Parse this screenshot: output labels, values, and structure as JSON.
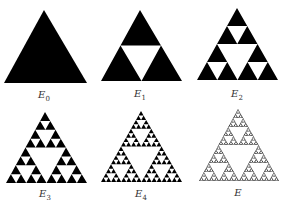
{
  "figure": {
    "fill_color": "#000000",
    "background": "#ffffff",
    "panels": [
      {
        "label": "E",
        "subscript": "0",
        "level": 0,
        "apex": [
          44,
          10
        ],
        "left": [
          4,
          83
        ],
        "right": [
          87,
          83
        ],
        "label_pos": [
          44,
          90
        ]
      },
      {
        "label": "E",
        "subscript": "1",
        "level": 1,
        "apex": [
          140,
          10
        ],
        "left": [
          101,
          81
        ],
        "right": [
          182,
          81
        ],
        "label_pos": [
          140,
          89
        ]
      },
      {
        "label": "E",
        "subscript": "2",
        "level": 2,
        "apex": [
          237,
          8
        ],
        "left": [
          197,
          80
        ],
        "right": [
          278,
          80
        ],
        "label_pos": [
          237,
          89
        ]
      },
      {
        "label": "E",
        "subscript": "3",
        "level": 3,
        "apex": [
          45,
          112
        ],
        "left": [
          6,
          183
        ],
        "right": [
          87,
          183
        ],
        "label_pos": [
          45,
          189
        ]
      },
      {
        "label": "E",
        "subscript": "4",
        "level": 4,
        "apex": [
          141,
          111
        ],
        "left": [
          101,
          182
        ],
        "right": [
          182,
          182
        ],
        "label_pos": [
          141,
          189
        ]
      },
      {
        "label": "E",
        "subscript": "",
        "level": 6,
        "apex": [
          238,
          109
        ],
        "left": [
          199,
          181
        ],
        "right": [
          279,
          181
        ],
        "label_pos": [
          238,
          188
        ]
      }
    ]
  }
}
